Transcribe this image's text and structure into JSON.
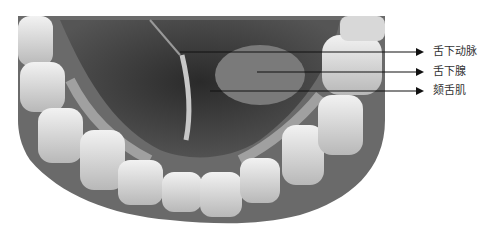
{
  "figure": {
    "labels": [
      {
        "text": "舌下动脉",
        "y": 52,
        "line_start_x": 180
      },
      {
        "text": "舌下腺",
        "y": 72,
        "line_start_x": 257
      },
      {
        "text": "颏舌肌",
        "y": 91,
        "line_start_x": 210
      }
    ]
  }
}
